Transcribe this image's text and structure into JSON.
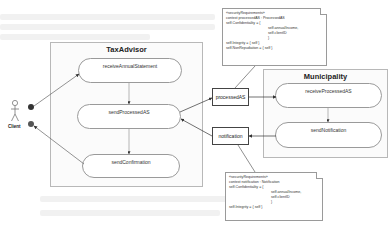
{
  "actor": {
    "label": "Client"
  },
  "swimlanes": [
    {
      "title": "TaxAdvisor",
      "states": [
        "receiveAnnualStatement",
        "sendProcessedAS",
        "sendConfirmation"
      ]
    },
    {
      "title": "Municipality",
      "states": [
        "receiveProcessedAS",
        "sendNotification"
      ]
    }
  ],
  "objects": [
    {
      "label": "processedAS"
    },
    {
      "label": "notification"
    }
  ],
  "notes": [
    {
      "lines": [
        "«securityRequirements»",
        "context processedAS : ProcessedAS",
        "self.Confidentiality = {",
        "self.annualIncome,",
        "self.clientID",
        "}",
        "self.Integrity = { self }",
        "self.NonRepudiation = { self }"
      ]
    },
    {
      "lines": [
        "«securityRequirements»",
        "context notification : Notification",
        "self.Confidentiality = {",
        "self.annualIncome,",
        "self.clientID",
        "}",
        "self.Integrity = { self }"
      ]
    }
  ],
  "colors": {
    "border": "#9a9a9a",
    "lane_bg": "#fbfbfb",
    "port": "#333333"
  }
}
